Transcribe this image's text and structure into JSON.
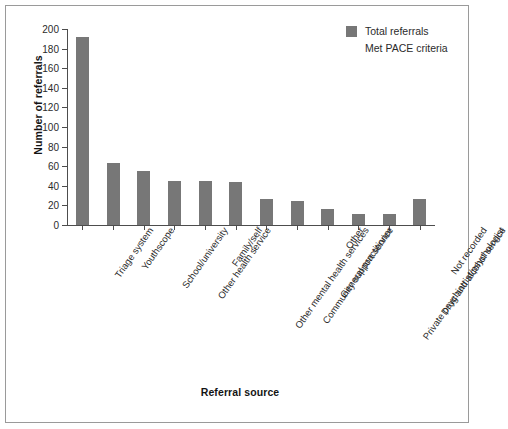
{
  "chart_data": {
    "type": "bar",
    "title": "",
    "xlabel": "Referral source",
    "ylabel": "Number of referrals",
    "ylim": [
      0,
      200
    ],
    "ytick_step": 20,
    "yticks": [
      0,
      20,
      40,
      60,
      80,
      100,
      120,
      140,
      160,
      180,
      200
    ],
    "grid": false,
    "legend_position": "top-right",
    "categories": [
      "Triage system",
      "Youthscope",
      "School/university",
      "Other health service",
      "Family/self",
      "Other mental health services",
      "Community support service",
      "General practitioner",
      "Other",
      "Private psychiatrist/psychologist",
      "Drug and alcohol service",
      "Not recorded"
    ],
    "series": [
      {
        "name": "Total referrals",
        "color": "#777777",
        "values": [
          192,
          63,
          55,
          45,
          45,
          44,
          27,
          25,
          16,
          11,
          11,
          27
        ]
      },
      {
        "name": "Met PACE criteria",
        "color": "#ffffff",
        "values": [
          0,
          0,
          0,
          0,
          0,
          0,
          0,
          0,
          0,
          0,
          0,
          0
        ]
      }
    ]
  },
  "legend": {
    "items": [
      {
        "label": "Total referrals",
        "swatch": true
      },
      {
        "label": "Met PACE criteria",
        "swatch": false
      }
    ]
  },
  "axes": {
    "y_title": "Number of referrals",
    "x_title": "Referral source"
  }
}
